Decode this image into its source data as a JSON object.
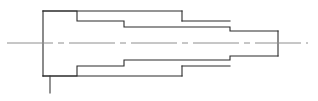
{
  "drawing": {
    "title": "Stepped Shaft Profile",
    "type": "engineering-part-outline",
    "view": "longitudinal-section",
    "canvas": {
      "width": 318,
      "height": 101,
      "background": "#ffffff"
    },
    "colors": {
      "outline": "#2b2b2b",
      "centerline": "#8e8e8e",
      "leader": "#3a3a3a",
      "background": "#ffffff"
    },
    "axis": {
      "label": "centerline",
      "y": 43,
      "x_start": 7,
      "x_end": 308,
      "style": "dash-dot",
      "dash_pattern": "46 5 6 5"
    },
    "steps": [
      {
        "name": "flange-face",
        "x": 43,
        "half_height": 32
      },
      {
        "name": "step-1",
        "x": 77,
        "half_height": 22
      },
      {
        "name": "step-2",
        "x": 124,
        "half_height": 16
      },
      {
        "name": "step-3",
        "x": 182,
        "half_height": 22
      },
      {
        "name": "step-4",
        "x": 230,
        "half_height": 12
      },
      {
        "name": "end-face",
        "x": 278,
        "half_height": 12
      }
    ],
    "outline_path": "M 43 11 L 77 11 L 77 21 L 182 21 L 182 11 L 43 11 L 43 76 L 77 76 L 77 66 L 182 66 L 182 76 L 43 76",
    "upper_profile_path": "M 43 11 L 77 11 L 77 21 L 124 21 L 124 27 L 230 27 L 230 31 L 278 31",
    "upper_inner_path": "M 182 11 L 182 21",
    "upper_ledge_path": "M 124 21 L 182 21 L 182 21",
    "lower_profile_path": "M 43 76 L 77 76 L 77 66 L 124 66 L 124 60 L 230 60 L 230 56 L 278 56",
    "lower_inner_path": "M 182 76 L 182 66",
    "left_face_path": "M 43 11 L 43 76",
    "right_face_path": "M 278 31 L 278 56",
    "upper_rib_path": "M 182 21 L 230 21",
    "lower_rib_path": "M 182 66 L 230 66",
    "leader": {
      "name": "leader-line",
      "x": 50,
      "y_start": 76,
      "y_end": 93
    }
  }
}
